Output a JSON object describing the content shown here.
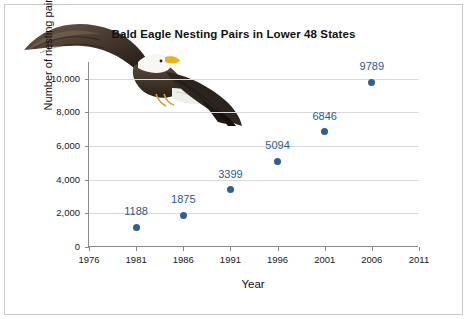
{
  "chart_data": {
    "type": "scatter",
    "title": "Bald Eagle Nesting Pairs in Lower 48 States",
    "xlabel": "Year",
    "ylabel": "Number of nesting pairs",
    "x": [
      1981,
      1986,
      1991,
      1996,
      2001,
      2006
    ],
    "values": [
      1188,
      1875,
      3399,
      5094,
      6846,
      9789
    ],
    "point_labels": [
      "1188",
      "1875",
      "3399",
      "5094",
      "6846",
      "9789"
    ],
    "xlim": [
      1976,
      2011
    ],
    "ylim": [
      0,
      11000
    ],
    "xticks": [
      "1976",
      "1981",
      "1986",
      "1991",
      "1996",
      "2001",
      "2006",
      "2011"
    ],
    "yticks": [
      "0",
      "2,000",
      "4,000",
      "6,000",
      "8,000",
      "10,000"
    ],
    "grid": "horizontal",
    "legend": "none",
    "marker_color": "#2f5f93",
    "label_color": "#2a5a96"
  },
  "figure": {
    "illustration_name": "bald-eagle-photo"
  }
}
